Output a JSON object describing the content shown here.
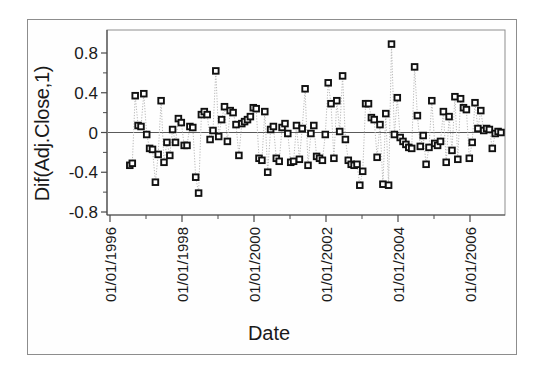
{
  "chart_data": {
    "type": "line",
    "title": "",
    "subtitle": "",
    "xlabel": "Date",
    "ylabel": "Dif(Adj.Close,1)",
    "ylim": [
      -0.8,
      1.0
    ],
    "xlim": [
      "01/01/1996",
      "01/01/2007"
    ],
    "grid": false,
    "legend": null,
    "marker": "open-square",
    "line_style": "dotted",
    "y_ticks": [
      "0.8",
      "0.4",
      "0",
      "-0.4",
      "-0.8"
    ],
    "y_tick_values": [
      0.8,
      0.4,
      0,
      -0.4,
      -0.8
    ],
    "x_ticks": [
      "01/01/1996",
      "01/01/1998",
      "01/01/2000",
      "01/01/2002",
      "01/01/2004",
      "01/01/2006"
    ],
    "x_tick_rotation_degrees": -90,
    "zero_reference_line": 0,
    "colors": {
      "marker_edge": "#111111",
      "marker_fill": "#ffffff",
      "line": "#b8b8b8",
      "axis": "#4a4a4a",
      "frame": "#8d8d8d",
      "text": "#1a1a1a",
      "background": "#ffffff"
    },
    "series": [
      {
        "name": "Dif(Adj.Close,1)",
        "x": [
          1996.55,
          1996.62,
          1996.7,
          1996.78,
          1996.86,
          1996.94,
          1997.02,
          1997.1,
          1997.18,
          1997.26,
          1997.34,
          1997.42,
          1997.5,
          1997.58,
          1997.66,
          1997.74,
          1997.82,
          1997.9,
          1997.98,
          1998.06,
          1998.14,
          1998.22,
          1998.3,
          1998.38,
          1998.46,
          1998.54,
          1998.62,
          1998.7,
          1998.78,
          1998.86,
          1998.94,
          1999.02,
          1999.1,
          1999.18,
          1999.26,
          1999.34,
          1999.42,
          1999.5,
          1999.58,
          1999.66,
          1999.74,
          1999.82,
          1999.9,
          1999.98,
          2000.06,
          2000.14,
          2000.22,
          2000.3,
          2000.38,
          2000.46,
          2000.54,
          2000.62,
          2000.7,
          2000.78,
          2000.86,
          2000.94,
          2001.02,
          2001.1,
          2001.18,
          2001.26,
          2001.34,
          2001.42,
          2001.5,
          2001.58,
          2001.66,
          2001.74,
          2001.82,
          2001.9,
          2001.98,
          2002.06,
          2002.14,
          2002.22,
          2002.3,
          2002.38,
          2002.46,
          2002.54,
          2002.62,
          2002.7,
          2002.78,
          2002.86,
          2002.94,
          2003.02,
          2003.1,
          2003.18,
          2003.26,
          2003.34,
          2003.42,
          2003.5,
          2003.58,
          2003.66,
          2003.74,
          2003.82,
          2003.9,
          2003.98,
          2004.06,
          2004.14,
          2004.22,
          2004.3,
          2004.38,
          2004.46,
          2004.54,
          2004.62,
          2004.7,
          2004.78,
          2004.86,
          2004.94,
          2005.02,
          2005.1,
          2005.18,
          2005.26,
          2005.34,
          2005.42,
          2005.5,
          2005.58,
          2005.66,
          2005.74,
          2005.82,
          2005.9,
          2005.98,
          2006.06,
          2006.14,
          2006.22,
          2006.3,
          2006.38,
          2006.46,
          2006.54,
          2006.62,
          2006.7,
          2006.78,
          2006.86
        ],
        "y": [
          -0.33,
          -0.31,
          0.37,
          0.07,
          0.06,
          0.39,
          -0.02,
          -0.16,
          -0.17,
          -0.5,
          -0.22,
          0.32,
          -0.3,
          -0.1,
          -0.23,
          0.03,
          -0.1,
          0.14,
          0.1,
          -0.13,
          -0.13,
          0.06,
          0.05,
          -0.45,
          -0.61,
          0.18,
          0.21,
          0.18,
          -0.07,
          0.02,
          0.62,
          -0.04,
          0.13,
          0.26,
          -0.09,
          0.22,
          0.2,
          0.08,
          -0.23,
          0.09,
          0.11,
          0.13,
          0.16,
          0.25,
          0.24,
          -0.26,
          -0.28,
          0.21,
          -0.4,
          0.03,
          0.06,
          -0.26,
          -0.29,
          0.05,
          0.09,
          -0.01,
          -0.3,
          -0.29,
          0.07,
          -0.27,
          0.04,
          0.44,
          -0.33,
          -0.01,
          0.07,
          -0.24,
          -0.26,
          -0.28,
          -0.02,
          0.5,
          0.29,
          -0.26,
          0.32,
          0.01,
          0.57,
          -0.07,
          -0.28,
          -0.32,
          -0.33,
          -0.32,
          -0.53,
          -0.39,
          0.29,
          0.29,
          0.15,
          0.13,
          -0.25,
          0.08,
          -0.52,
          0.19,
          -0.53,
          0.89,
          -0.02,
          0.35,
          -0.05,
          -0.09,
          -0.12,
          -0.15,
          -0.16,
          0.66,
          0.17,
          -0.14,
          -0.03,
          -0.32,
          -0.15,
          0.32,
          -0.11,
          -0.13,
          -0.09,
          0.21,
          -0.3,
          0.16,
          -0.18,
          0.36,
          -0.27,
          0.34,
          0.25,
          0.23,
          -0.26,
          -0.1,
          0.3,
          0.04,
          0.22,
          0.02,
          0.04,
          0.03,
          -0.16,
          -0.01,
          0.01,
          0.0
        ]
      }
    ]
  }
}
